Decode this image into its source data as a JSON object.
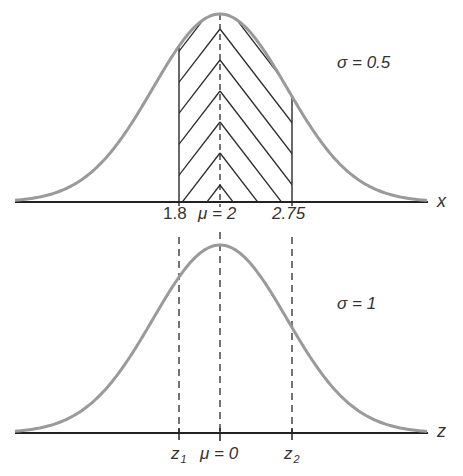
{
  "colors": {
    "curve": "#9a9a9a",
    "axis": "#222222",
    "hatch": "#2a2a2a",
    "text": "#333333",
    "background": "#ffffff"
  },
  "top_panel": {
    "sigma_label": "σ = 0.5",
    "axis_label": "x",
    "tick_labels": {
      "left": "1.8",
      "mean": "μ = 2",
      "right": "2.75"
    },
    "mean": 2,
    "sigma": 0.5,
    "shaded_interval": [
      1.8,
      2.75
    ],
    "hatch_pattern": "chevron"
  },
  "bottom_panel": {
    "sigma_label": "σ = 1",
    "axis_label": "z",
    "tick_labels": {
      "left": "z",
      "left_sub": "1",
      "mean": "μ = 0",
      "right": "z",
      "right_sub": "2"
    },
    "mean": 0,
    "sigma": 1
  },
  "connectors": {
    "style": "dashed",
    "description": "Vertical dashed lines map 1.8 → z1, μ=2 → μ=0, 2.75 → z2"
  }
}
